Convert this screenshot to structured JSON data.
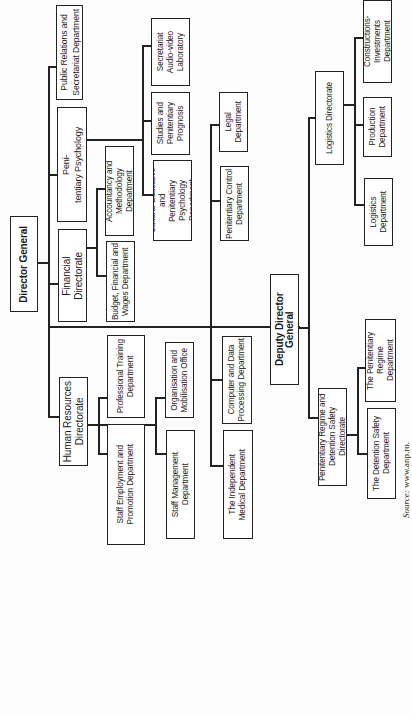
{
  "diagram": {
    "type": "org-chart",
    "orientation": "rotated-90-ccw",
    "root": "Director General",
    "nodes": {
      "director_general": "Director General",
      "public_relations": "Public Relations and\nSecretariat Department",
      "education_directorate": "Education, Studies and Peni-\ntentiary Psychology Directorate",
      "financial_directorate": "Financial\nDirectorate",
      "human_resources": "Human Resources\nDirectorate",
      "budget_dept": "Budget, Financial and\nWages Department",
      "accountancy_dept": "Accountancy and\nMethodology Department",
      "professional_training": "Professional Training\nDepartment",
      "staff_employment": "Staff Employment and\nPromotion Department",
      "organisation_office": "Organisation and\nMobilisation Office",
      "staff_management": "Staff Management\nDepartment",
      "cultural_educative": "Cultural-Educative and\nPenitentiary Psychology\nDepartment",
      "studies_prognosis": "Studies and\nPenitentiary\nPrognosis",
      "secretariat_lab": "Secretariat\nAudio-video\nLaboratory",
      "penitentiary_control": "Penitentiary Control\nDepartment",
      "legal_dept": "Legal\nDepartment",
      "computer_data": "Computer and Data\nProcessing Department",
      "independent_medical": "The Independent\nMedical Department",
      "deputy_director": "Deputy Director General",
      "logistics_directorate": "Logistics Directorate",
      "constructions_dept": "Constructions-Investments\nDepartment",
      "production_dept": "Production\nDepartment",
      "logistics_dept": "Logistics\nDepartment",
      "regime_directorate": "Penitentiary Regime and\nDetention Safety Directorate",
      "regime_dept": "The Penitentiary Regime\nDepartment",
      "detention_safety": "The Detention Safety\nDepartment"
    },
    "hierarchy": {
      "Director General": [
        "Public Relations and Secretariat Department",
        "Education, Studies and Penitentiary Psychology Directorate",
        "Financial Directorate",
        "Human Resources Directorate",
        "Penitentiary Control Department",
        "Legal Department",
        "Computer and Data Processing Department",
        "The Independent Medical Department",
        "Deputy Director General"
      ],
      "Financial Directorate": [
        "Budget, Financial and Wages Department",
        "Accountancy and Methodology Department"
      ],
      "Education, Studies and Penitentiary Psychology Directorate": [
        "Cultural-Educative and Penitentiary Psychology Department",
        "Studies and Penitentiary Prognosis",
        "Secretariat Audio-video Laboratory"
      ],
      "Human Resources Directorate": [
        "Professional Training Department",
        "Staff Employment and Promotion Department",
        "Organisation and Mobilisation Office",
        "Staff Management Department"
      ],
      "Deputy Director General": [
        "Logistics Directorate",
        "Penitentiary Regime and Detention Safety Directorate"
      ],
      "Logistics Directorate": [
        "Constructions-Investments Department",
        "Production Department",
        "Logistics Department"
      ],
      "Penitentiary Regime and Detention Safety Directorate": [
        "The Penitentiary Regime Department",
        "The Detention Safety Department"
      ]
    },
    "source": {
      "label": "Source:",
      "value": "www.anp.ro."
    }
  }
}
